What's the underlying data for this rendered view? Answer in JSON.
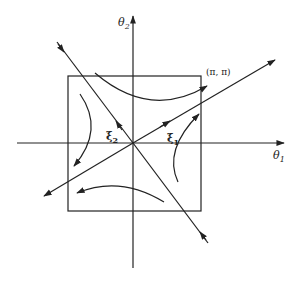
{
  "diagram": {
    "type": "phase-portrait",
    "axes": {
      "horizontal": {
        "label": "θ",
        "subscript": "1"
      },
      "vertical": {
        "label": "θ",
        "subscript": "2"
      }
    },
    "corner_label": "(π, π)",
    "eigenvectors": [
      {
        "label": "ξ",
        "subscript": "1",
        "direction": "outward"
      },
      {
        "label": "ξ",
        "subscript": "2",
        "direction": "inward"
      }
    ],
    "colors": {
      "stroke": "#222222",
      "background": "#ffffff"
    }
  }
}
